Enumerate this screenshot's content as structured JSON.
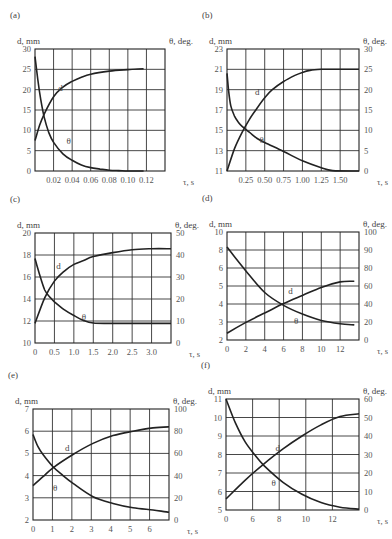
{
  "chart_data": [
    {
      "id": "a",
      "panel_label": "(a)",
      "type": "line",
      "xlabel": "τ, s",
      "ylabel_left": "d, mm",
      "ylabel_right": "θ, deg.",
      "x_ticks": [
        "0.02",
        "0.04",
        "0.06",
        "0.08",
        "0.10",
        "0.12"
      ],
      "x_range": [
        0,
        0.14
      ],
      "y_left_ticks": [
        "0",
        "5",
        "10",
        "15",
        "20",
        "25",
        "30"
      ],
      "y_left_range": [
        0,
        32
      ],
      "y_right_ticks": [],
      "y_right_range": [
        0,
        32
      ],
      "grid": true,
      "series": [
        {
          "name": "d",
          "axis": "left",
          "x": [
            0,
            0.005,
            0.01,
            0.02,
            0.03,
            0.04,
            0.05,
            0.06,
            0.08,
            0.1,
            0.117
          ],
          "values": [
            8,
            12,
            15,
            19.5,
            22,
            23.5,
            24.6,
            25.4,
            26.2,
            26.6,
            26.8
          ]
        },
        {
          "name": "θ",
          "axis": "left",
          "x": [
            0,
            0.003,
            0.006,
            0.01,
            0.015,
            0.02,
            0.03,
            0.04,
            0.05,
            0.06,
            0.07,
            0.08,
            0.09,
            0.1,
            0.117
          ],
          "values": [
            30,
            24,
            19,
            14,
            10,
            7.5,
            4.5,
            2.8,
            1.6,
            0.9,
            0.5,
            0.2,
            0.1,
            0,
            0
          ]
        }
      ],
      "annotations": [
        {
          "text": "d",
          "x": 0.025,
          "y": 21
        },
        {
          "text": "θ",
          "x": 0.034,
          "y": 7
        }
      ]
    },
    {
      "id": "b",
      "panel_label": "(b)",
      "type": "line",
      "xlabel": "τ, s",
      "ylabel_left": "d, mm",
      "ylabel_right": "θ, deg.",
      "x_ticks": [
        "0.25",
        "0.50",
        "0.75",
        "1.00",
        "1.25",
        "1.50"
      ],
      "x_range": [
        0,
        1.75
      ],
      "y_left_ticks": [
        "11",
        "13",
        "15",
        "17",
        "19",
        "21",
        "23"
      ],
      "y_left_range": [
        11,
        23
      ],
      "y_right_ticks": [
        "0",
        "5",
        "10",
        "15",
        "20",
        "25",
        "30"
      ],
      "y_right_range": [
        0,
        30
      ],
      "grid": true,
      "series": [
        {
          "name": "d",
          "axis": "left",
          "x": [
            0,
            0.1,
            0.2,
            0.3,
            0.4,
            0.5,
            0.6,
            0.75,
            0.9,
            1.0,
            1.1,
            1.25,
            1.4,
            1.75
          ],
          "values": [
            11,
            13.2,
            14.8,
            16.1,
            17.2,
            18.2,
            19,
            19.8,
            20.4,
            20.7,
            20.9,
            21,
            21,
            21
          ]
        },
        {
          "name": "θ",
          "axis": "right",
          "x": [
            0,
            0.02,
            0.05,
            0.1,
            0.15,
            0.2,
            0.3,
            0.4,
            0.5,
            0.75,
            1.0,
            1.25,
            1.4,
            1.75
          ],
          "values": [
            24,
            20,
            16,
            13.5,
            12,
            11,
            9.5,
            8,
            7,
            4.8,
            2.5,
            0.8,
            0.1,
            0
          ]
        }
      ],
      "annotations": [
        {
          "text": "d",
          "x": 0.37,
          "y": 18.5
        },
        {
          "text": "θ",
          "x": 0.43,
          "y": 13.8
        }
      ]
    },
    {
      "id": "c",
      "panel_label": "(c)",
      "type": "line",
      "xlabel": "τ, s",
      "ylabel_left": "d, mm",
      "ylabel_right": "θ, deg.",
      "x_ticks": [
        "0",
        "0.5",
        "1.0",
        "1.5",
        "2.0",
        "2.5",
        "3.0"
      ],
      "x_range": [
        0,
        3.5
      ],
      "y_left_ticks": [
        "10",
        "12",
        "14",
        "16",
        "18",
        "20"
      ],
      "y_left_range": [
        10,
        21.2
      ],
      "y_right_ticks": [
        "0",
        "10",
        "20",
        "30",
        "40",
        "50"
      ],
      "y_right_range": [
        0,
        56
      ],
      "grid": true,
      "series": [
        {
          "name": "d",
          "axis": "left",
          "x": [
            0,
            0.25,
            0.5,
            0.75,
            1.0,
            1.25,
            1.5,
            2.0,
            2.5,
            3.0,
            3.5
          ],
          "values": [
            12,
            14.6,
            16.3,
            17.3,
            18,
            18.4,
            18.8,
            19.2,
            19.5,
            19.6,
            19.6
          ]
        },
        {
          "name": "θ",
          "axis": "right",
          "x": [
            0,
            0.1,
            0.25,
            0.4,
            0.5,
            0.75,
            1.0,
            1.25,
            1.5,
            2.0,
            3.5
          ],
          "values": [
            43,
            36,
            27,
            23,
            21,
            17,
            14,
            11.5,
            10.2,
            10,
            10
          ]
        }
      ],
      "annotations": [
        {
          "text": "d",
          "x": 0.55,
          "y": 17.5
        },
        {
          "text": "θ",
          "x": 1.2,
          "y": 12.3
        }
      ]
    },
    {
      "id": "d",
      "panel_label": "(d)",
      "type": "line",
      "xlabel": "τ, s",
      "ylabel_left": "d, mm",
      "ylabel_right": "θ, deg.",
      "x_ticks": [
        "0",
        "2",
        "4",
        "6",
        "8",
        "10",
        "12"
      ],
      "x_range": [
        0,
        14
      ],
      "y_left_ticks": [
        "2",
        "3",
        "4",
        "5",
        "6",
        "8",
        "10"
      ],
      "y_left_range": [
        2,
        10
      ],
      "y_right_ticks": [
        "0",
        "20",
        "40",
        "60",
        "80",
        "90",
        "100"
      ],
      "y_right_range": [
        0,
        100
      ],
      "grid": true,
      "series": [
        {
          "name": "d",
          "axis": "left",
          "x": [
            0,
            2,
            4,
            6,
            8,
            10,
            12,
            13.5
          ],
          "values": [
            2.5,
            3.3,
            4.0,
            4.7,
            5.3,
            5.9,
            6.3,
            6.35
          ]
        },
        {
          "name": "θ",
          "axis": "right",
          "x": [
            0,
            2,
            4,
            6,
            8,
            10,
            12,
            13.5
          ],
          "values": [
            86,
            64,
            44,
            32,
            24,
            18,
            15,
            14
          ]
        }
      ],
      "annotations": [
        {
          "text": "d",
          "x": 6.5,
          "y": 5.4
        },
        {
          "text": "θ",
          "x": 7.1,
          "y": 3.2
        }
      ]
    },
    {
      "id": "e",
      "panel_label": "(e)",
      "type": "line",
      "xlabel": "τ, s",
      "ylabel_left": "d, mm",
      "ylabel_right": "θ, deg.",
      "x_ticks": [
        "0",
        "1",
        "2",
        "3",
        "4",
        "5",
        "6"
      ],
      "x_range": [
        0,
        6.8
      ],
      "y_left_ticks": [
        "2",
        "3",
        "4",
        "5",
        "6",
        "7"
      ],
      "y_left_range": [
        2,
        7
      ],
      "y_right_ticks": [
        "0",
        "20",
        "40",
        "60",
        "80",
        "100"
      ],
      "y_right_range": [
        0,
        100
      ],
      "grid": true,
      "series": [
        {
          "name": "d",
          "axis": "left",
          "x": [
            0,
            0.5,
            1,
            2,
            3,
            4,
            5,
            6,
            6.8
          ],
          "values": [
            3.55,
            3.95,
            4.35,
            4.95,
            5.45,
            5.8,
            6.0,
            6.15,
            6.2
          ]
        },
        {
          "name": "θ",
          "axis": "right",
          "x": [
            0,
            0.25,
            0.5,
            1,
            1.5,
            2,
            3,
            4,
            5,
            6,
            6.8
          ],
          "values": [
            77,
            66,
            59,
            48,
            40,
            33,
            21,
            15,
            11,
            9,
            7
          ]
        }
      ],
      "annotations": [
        {
          "text": "d",
          "x": 1.6,
          "y": 5.1
        },
        {
          "text": "θ",
          "x": 1.0,
          "y": 3.3
        }
      ]
    },
    {
      "id": "f",
      "panel_label": "(f)",
      "type": "line",
      "xlabel": "τ, s",
      "ylabel_left": "d, mm",
      "ylabel_right": "θ, deg.",
      "x_ticks": [
        "0",
        "6",
        "8",
        "10",
        "12"
      ],
      "x_range": [
        0,
        14
      ],
      "y_left_ticks": [
        "5",
        "6",
        "7",
        "8",
        "9",
        "10",
        "11"
      ],
      "y_left_range": [
        5,
        11
      ],
      "y_right_ticks": [
        "0",
        "10",
        "20",
        "30",
        "40",
        "50",
        "60"
      ],
      "y_right_range": [
        0,
        60
      ],
      "grid": true,
      "series": [
        {
          "name": "d",
          "axis": "left",
          "x": [
            0,
            2,
            4,
            6,
            8,
            10,
            12,
            14
          ],
          "values": [
            5.6,
            6.6,
            7.5,
            8.3,
            9.0,
            9.6,
            10.05,
            10.2
          ]
        },
        {
          "name": "θ",
          "axis": "right",
          "x": [
            0,
            1,
            2,
            3,
            4,
            6,
            8,
            10,
            12,
            14
          ],
          "values": [
            60,
            47,
            37,
            30,
            24,
            15,
            8.5,
            4,
            1.5,
            0.5
          ]
        }
      ],
      "annotations": [
        {
          "text": "d",
          "x": 5.2,
          "y": 8.2
        },
        {
          "text": "θ",
          "x": 4.8,
          "y": 6.3
        }
      ]
    }
  ],
  "frames": {
    "a": {
      "x0": 35,
      "x1": 165,
      "y0": 49,
      "y1": 171,
      "v_grid": 7,
      "h_grid": 6
    },
    "b": {
      "x0": 227,
      "x1": 359,
      "y0": 49,
      "y1": 171,
      "v_grid": 7,
      "h_grid": 6
    },
    "c": {
      "x0": 35,
      "x1": 171,
      "y0": 233,
      "y1": 343,
      "v_grid": 7,
      "h_grid": 5
    },
    "d": {
      "x0": 227,
      "x1": 359,
      "y0": 232,
      "y1": 340,
      "v_grid": 7,
      "h_grid": 6
    },
    "e": {
      "x0": 33,
      "x1": 169,
      "y0": 409,
      "y1": 520,
      "v_grid": 7,
      "h_grid": 5
    },
    "f": {
      "x0": 226,
      "x1": 359,
      "y0": 399,
      "y1": 510,
      "v_grid": 5,
      "h_grid": 6
    }
  }
}
